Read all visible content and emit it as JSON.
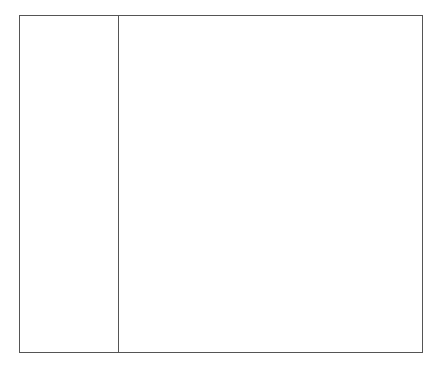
{
  "layout": {
    "border_color": "#555555",
    "background_color": "#ffffff"
  },
  "left_pane": {
    "items": []
  },
  "right_pane": {
    "content": ""
  }
}
